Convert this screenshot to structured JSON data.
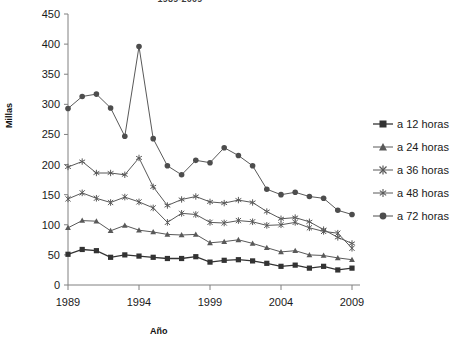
{
  "chart_data": {
    "type": "line",
    "title": "1989-2009",
    "xlabel": "Año",
    "ylabel": "Millas",
    "xlim": [
      1989,
      2009
    ],
    "ylim": [
      0,
      450
    ],
    "ytick_labels": [
      "450",
      "400",
      "350",
      "300",
      "250",
      "200",
      "150",
      "100",
      "50",
      "0"
    ],
    "yticks": [
      450,
      400,
      350,
      300,
      250,
      200,
      150,
      100,
      50,
      0
    ],
    "xtick_labels": [
      "1989",
      "1994",
      "1999",
      "2004",
      "2009"
    ],
    "xticks": [
      1989,
      1994,
      1999,
      2004,
      2009
    ],
    "grid": false,
    "legend_position": "right",
    "x": [
      1989,
      1990,
      1991,
      1992,
      1993,
      1994,
      1995,
      1996,
      1997,
      1998,
      1999,
      2000,
      2001,
      2002,
      2003,
      2004,
      2005,
      2006,
      2007,
      2008,
      2009
    ],
    "series": [
      {
        "name": "a 12 horas",
        "marker": "square",
        "color": "#333333",
        "values": [
          51,
          59,
          57,
          46,
          50,
          48,
          46,
          44,
          44,
          47,
          38,
          41,
          42,
          40,
          36,
          31,
          33,
          28,
          31,
          25,
          28
        ]
      },
      {
        "name": "a 24 horas",
        "marker": "triangle",
        "color": "#595959",
        "values": [
          95,
          107,
          106,
          90,
          99,
          91,
          88,
          84,
          83,
          84,
          70,
          72,
          75,
          69,
          62,
          55,
          57,
          50,
          49,
          45,
          42
        ]
      },
      {
        "name": "a 36 horas",
        "marker": "asterisk",
        "color": "#595959",
        "values": [
          143,
          153,
          144,
          137,
          146,
          138,
          128,
          104,
          119,
          117,
          104,
          103,
          107,
          105,
          99,
          100,
          104,
          95,
          89,
          86,
          61
        ]
      },
      {
        "name": "a 48 horas",
        "marker": "star",
        "color": "#595959",
        "values": [
          196,
          205,
          186,
          186,
          183,
          211,
          163,
          132,
          142,
          147,
          138,
          136,
          141,
          137,
          122,
          110,
          112,
          105,
          92,
          79,
          69
        ]
      },
      {
        "name": "a 72 horas",
        "marker": "circle",
        "color": "#4d4d4d",
        "values": [
          293,
          313,
          317,
          294,
          247,
          396,
          243,
          198,
          183,
          207,
          203,
          228,
          215,
          198,
          159,
          150,
          154,
          147,
          144,
          124,
          117
        ]
      }
    ]
  },
  "legend": {
    "items": [
      {
        "label": "a 12 horas"
      },
      {
        "label": "a 24 horas"
      },
      {
        "label": "a 36 horas"
      },
      {
        "label": "a 48 horas"
      },
      {
        "label": "a 72 horas"
      }
    ]
  }
}
